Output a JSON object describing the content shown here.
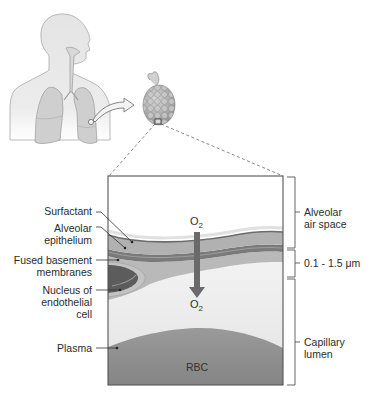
{
  "figure": {
    "colors": {
      "background": "#ffffff",
      "body_silhouette": "#e6e6e6",
      "body_outline": "#9a9a9a",
      "lung_fill": "#cfcfcf",
      "alveolar_air": "#ffffff",
      "surfactant_line": "#6e6e6e",
      "epithelium": "#b3b3b3",
      "basement_membrane": "#7a7a7a",
      "endothelium": "#a8a8a8",
      "nucleus": "#5a5a5a",
      "plasma": "#ececec",
      "rbc": "#8f8f8f",
      "o2_arrow": "#6a6a6a",
      "box_border": "#555555",
      "dashed_lines": "#666666"
    }
  },
  "left_labels": [
    {
      "id": "surfactant",
      "text": "Surfactant"
    },
    {
      "id": "alveolar-epithelium",
      "lines": [
        "Alveolar",
        "epithelium"
      ]
    },
    {
      "id": "fused-basement-membranes",
      "lines": [
        "Fused basement",
        "membranes"
      ]
    },
    {
      "id": "nucleus-endothelial",
      "lines": [
        "Nucleus of",
        "endothelial",
        "cell"
      ]
    },
    {
      "id": "plasma",
      "text": "Plasma"
    }
  ],
  "right_labels": [
    {
      "id": "alveolar-air-space",
      "lines": [
        "Alveolar",
        "air space"
      ]
    },
    {
      "id": "membrane-thickness",
      "text": "0.1 - 1.5 μm"
    },
    {
      "id": "capillary-lumen",
      "lines": [
        "Capillary",
        "lumen"
      ]
    }
  ],
  "gas": {
    "top": {
      "symbol": "O",
      "subscript": "2"
    },
    "bottom": {
      "symbol": "O",
      "subscript": "2"
    }
  },
  "rbc_label": "RBC"
}
